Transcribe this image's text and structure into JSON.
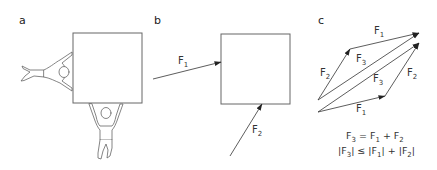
{
  "panels": {
    "a": {
      "label": "a",
      "description": "Two figures pushing a box from the left and from below"
    },
    "b": {
      "label": "b",
      "vectors": [
        {
          "name": "F",
          "sub": "1"
        },
        {
          "name": "F",
          "sub": "2"
        }
      ]
    },
    "c": {
      "label": "c",
      "vectors": {
        "upper_left": {
          "name": "F",
          "sub": "2"
        },
        "upper_top": {
          "name": "F",
          "sub": "1"
        },
        "upper_diag": {
          "name": "F",
          "sub": "3"
        },
        "lower_diag": {
          "name": "F",
          "sub": "3"
        },
        "lower_right": {
          "name": "F",
          "sub": "2"
        },
        "lower_bottom": {
          "name": "F",
          "sub": "1"
        }
      },
      "formulas": {
        "line1": {
          "lhs": "F",
          "lhs_sub": "3",
          "eq": " = F",
          "a_sub": "1",
          "plus": " + F",
          "b_sub": "2"
        },
        "line2": {
          "p1": "|F",
          "s1": "3",
          "p2": "| ≤ |F",
          "s2": "1",
          "p3": "| + |F",
          "s3": "2",
          "p4": "|"
        }
      }
    }
  },
  "colors": {
    "line": "#555555",
    "text": "#333333",
    "background": "#ffffff"
  }
}
